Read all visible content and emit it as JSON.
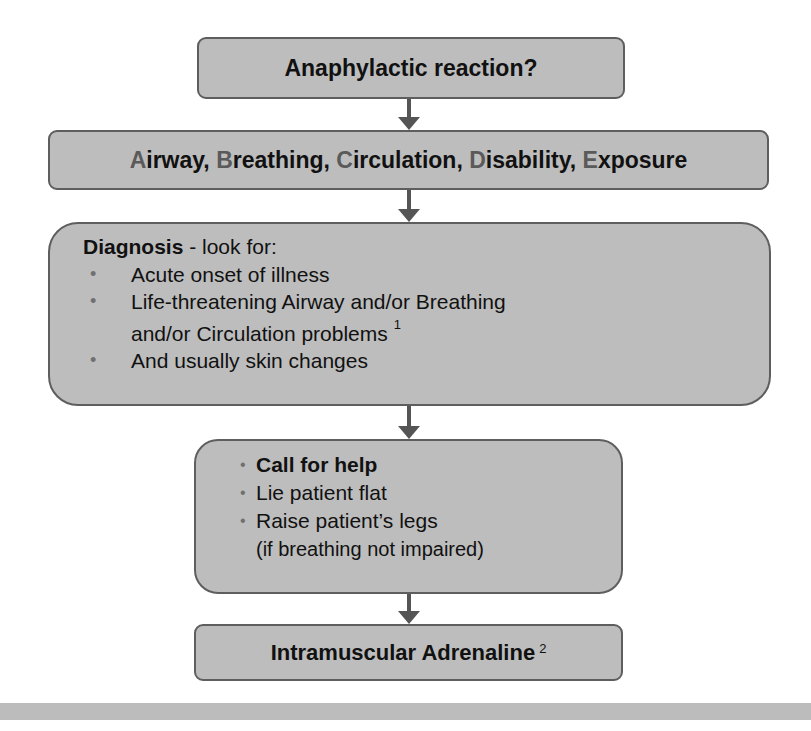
{
  "flowchart": {
    "step1": {
      "label": "Anaphylactic reaction?"
    },
    "step2": {
      "parts": [
        {
          "initial": "A",
          "rest": "irway, "
        },
        {
          "initial": "B",
          "rest": "reathing, "
        },
        {
          "initial": "C",
          "rest": "irculation, "
        },
        {
          "initial": "D",
          "rest": "isability, "
        },
        {
          "initial": "E",
          "rest": "xposure"
        }
      ]
    },
    "step3": {
      "title_bold": "Diagnosis",
      "title_rest": " - look for:",
      "bullet_glyph": "•",
      "items": [
        {
          "line1": "Acute onset of illness",
          "line2": "",
          "footnote": ""
        },
        {
          "line1": "Life-threatening Airway and/or Breathing",
          "line2": "and/or Circulation problems",
          "footnote": "1"
        },
        {
          "line1": "And usually skin changes",
          "line2": "",
          "footnote": ""
        }
      ]
    },
    "step4": {
      "bullet_glyph": "•",
      "items": [
        {
          "text": "Call for help",
          "bold": true
        },
        {
          "text": "Lie patient flat",
          "bold": false
        },
        {
          "text": "Raise patient’s legs",
          "bold": false
        }
      ],
      "note": "(if breathing not impaired)"
    },
    "step5": {
      "label": "Intramuscular Adrenaline",
      "footnote": "2"
    }
  },
  "colors": {
    "box_fill": "#bdbdbd",
    "box_border": "#5e5e5e",
    "arrow": "#555555",
    "initial_letter": "#5a5a5a",
    "bottom_bar": "#bcbcbc"
  }
}
